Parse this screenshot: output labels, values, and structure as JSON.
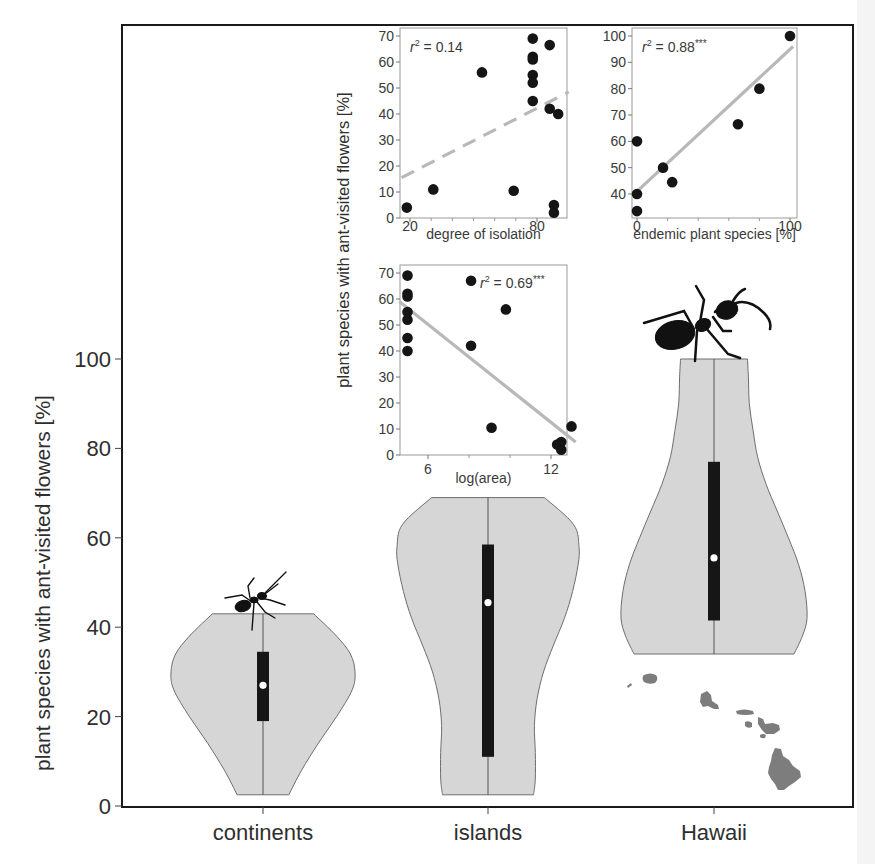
{
  "chart_data": [
    {
      "id": "main",
      "type": "violin",
      "title": "",
      "xlabel": "",
      "ylabel": "plant species with ant-visited flowers [%]",
      "ylim": [
        0,
        100
      ],
      "yticks": [
        0,
        20,
        40,
        60,
        80,
        100
      ],
      "categories": [
        "continents",
        "islands",
        "Hawaii"
      ],
      "series": [
        {
          "name": "continents",
          "min": 2.5,
          "max": 43,
          "q1": 19,
          "q3": 34.5,
          "median": 27,
          "profile": [
            [
              2.5,
              0.28
            ],
            [
              8,
              0.42
            ],
            [
              14,
              0.6
            ],
            [
              20,
              0.8
            ],
            [
              26,
              0.97
            ],
            [
              30,
              1.0
            ],
            [
              34,
              0.95
            ],
            [
              38,
              0.8
            ],
            [
              43,
              0.55
            ]
          ]
        },
        {
          "name": "islands",
          "min": 2.5,
          "max": 69,
          "q1": 11,
          "q3": 58.5,
          "median": 45.5,
          "profile": [
            [
              2.5,
              0.5
            ],
            [
              6,
              0.52
            ],
            [
              12,
              0.52
            ],
            [
              18,
              0.51
            ],
            [
              24,
              0.54
            ],
            [
              30,
              0.61
            ],
            [
              36,
              0.72
            ],
            [
              42,
              0.84
            ],
            [
              48,
              0.93
            ],
            [
              54,
              0.99
            ],
            [
              58,
              1.0
            ],
            [
              63,
              0.94
            ],
            [
              69,
              0.62
            ]
          ]
        },
        {
          "name": "Hawaii",
          "min": 34,
          "max": 100,
          "q1": 41.5,
          "q3": 77,
          "median": 55.5,
          "profile": [
            [
              34,
              0.86
            ],
            [
              38,
              0.95
            ],
            [
              42,
              1.0
            ],
            [
              48,
              0.98
            ],
            [
              54,
              0.91
            ],
            [
              60,
              0.8
            ],
            [
              66,
              0.68
            ],
            [
              72,
              0.56
            ],
            [
              78,
              0.47
            ],
            [
              84,
              0.42
            ],
            [
              90,
              0.38
            ],
            [
              96,
              0.37
            ],
            [
              100,
              0.36
            ]
          ]
        }
      ],
      "colors": {
        "violin_fill": "#d6d6d6",
        "violin_stroke": "#6e6e6e",
        "iqr_bar": "#161616",
        "median_dot": "#ffffff"
      }
    },
    {
      "id": "inset-isolation",
      "type": "scatter",
      "xlabel": "degree of isolation",
      "ylabel": "plant species with ant-visited flowers [%]",
      "annotation": "r² = 0.14",
      "annotation_parts": {
        "var": "r",
        "sup": "2",
        "rest": " = 0.14"
      },
      "xlim": [
        16,
        95
      ],
      "ylim": [
        0,
        70
      ],
      "xticks": [
        20,
        80
      ],
      "yticks": [
        0,
        10,
        20,
        30,
        40,
        50,
        60,
        70
      ],
      "trendline": {
        "style": "dashed",
        "x": [
          16,
          95
        ],
        "y": [
          15.5,
          48.5
        ]
      },
      "points": [
        {
          "x": 18.5,
          "y": 4
        },
        {
          "x": 31,
          "y": 11
        },
        {
          "x": 54,
          "y": 56
        },
        {
          "x": 69,
          "y": 10.5
        },
        {
          "x": 78,
          "y": 69
        },
        {
          "x": 78,
          "y": 62
        },
        {
          "x": 78,
          "y": 61
        },
        {
          "x": 78,
          "y": 55
        },
        {
          "x": 78,
          "y": 52
        },
        {
          "x": 78,
          "y": 45
        },
        {
          "x": 86,
          "y": 66.5
        },
        {
          "x": 86,
          "y": 42
        },
        {
          "x": 90,
          "y": 40
        },
        {
          "x": 88,
          "y": 5
        },
        {
          "x": 88,
          "y": 2
        }
      ]
    },
    {
      "id": "inset-endemic",
      "type": "scatter",
      "xlabel": "endemic plant species [%]",
      "ylabel": "",
      "annotation": "r² = 0.88***",
      "annotation_parts": {
        "var": "r",
        "sup": "2",
        "rest": " = 0.88",
        "stars": "***"
      },
      "xlim": [
        -3,
        102
      ],
      "ylim": [
        32,
        102
      ],
      "xticks": [
        0,
        100
      ],
      "yticks": [
        40,
        50,
        60,
        70,
        80,
        90,
        100
      ],
      "trendline": {
        "style": "solid",
        "x": [
          0,
          102
        ],
        "y": [
          41,
          96
        ]
      },
      "points": [
        {
          "x": 0,
          "y": 33.5
        },
        {
          "x": 0,
          "y": 40
        },
        {
          "x": 0,
          "y": 60
        },
        {
          "x": 17,
          "y": 50
        },
        {
          "x": 23,
          "y": 44.5
        },
        {
          "x": 66,
          "y": 66.5
        },
        {
          "x": 80,
          "y": 80
        },
        {
          "x": 100,
          "y": 100
        }
      ]
    },
    {
      "id": "inset-area",
      "type": "scatter",
      "xlabel": "log(area)",
      "ylabel": "",
      "annotation": "r² = 0.69***",
      "annotation_parts": {
        "var": "r",
        "sup": "2",
        "rest": " = 0.69",
        "stars": "***"
      },
      "xlim": [
        4.6,
        13.2
      ],
      "ylim": [
        0,
        70
      ],
      "xticks": [
        6,
        12
      ],
      "yticks": [
        0,
        10,
        20,
        30,
        40,
        50,
        60,
        70
      ],
      "trendline": {
        "style": "solid",
        "x": [
          4.6,
          13.2
        ],
        "y": [
          59,
          5
        ]
      },
      "points": [
        {
          "x": 5.0,
          "y": 69
        },
        {
          "x": 5.0,
          "y": 62
        },
        {
          "x": 5.0,
          "y": 61
        },
        {
          "x": 5.0,
          "y": 55
        },
        {
          "x": 5.0,
          "y": 52
        },
        {
          "x": 5.0,
          "y": 45
        },
        {
          "x": 5.0,
          "y": 40
        },
        {
          "x": 8.1,
          "y": 67
        },
        {
          "x": 8.1,
          "y": 42
        },
        {
          "x": 9.1,
          "y": 10.5
        },
        {
          "x": 9.8,
          "y": 56
        },
        {
          "x": 12.3,
          "y": 4
        },
        {
          "x": 12.5,
          "y": 5
        },
        {
          "x": 12.5,
          "y": 2
        },
        {
          "x": 13.0,
          "y": 11
        }
      ]
    }
  ],
  "shared_inset_ylabel": "plant species with ant-visited flowers [%]",
  "decorations": {
    "ant_small": "ant-silhouette-on-continents-violin",
    "ant_large": "ant-silhouette-on-hawaii-violin",
    "map": "hawaiian-islands-silhouette"
  }
}
